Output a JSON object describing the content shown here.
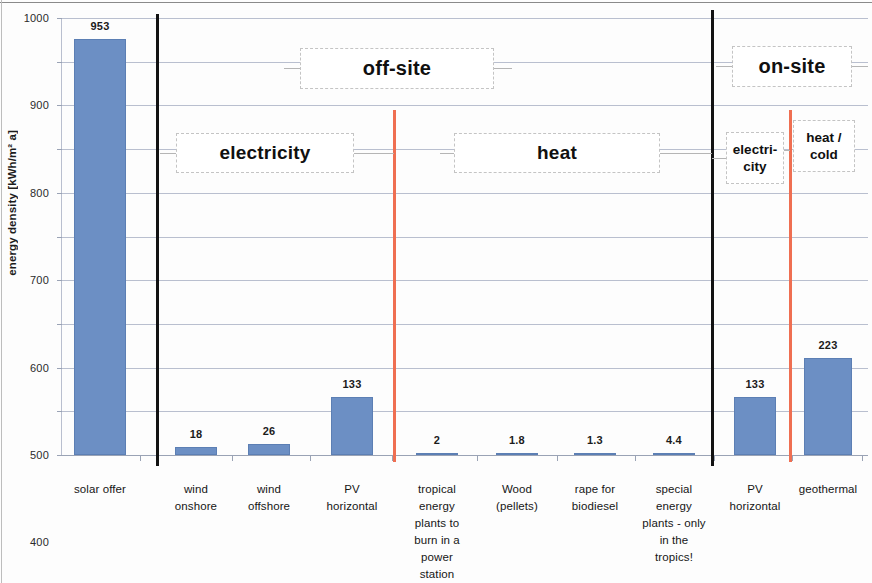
{
  "chart_data": {
    "type": "bar",
    "title": "",
    "xlabel": "",
    "ylabel": "energy density [kWh/m² a]",
    "ylim": [
      0,
      1000
    ],
    "ytick_step": 100,
    "yticks": [
      "1000",
      "900",
      "800",
      "700",
      "600",
      "500",
      "400",
      "300",
      "200",
      "100",
      "0"
    ],
    "grid": true,
    "legend": "none",
    "bar_color": "#6c8fc4",
    "categories": [
      "solar offer",
      "wind onshore",
      "wind offshore",
      "PV horizontal",
      "tropical energy plants to burn in a power station",
      "Wood (pellets)",
      "rape for biodiesel",
      "special energy plants - only in the tropics!",
      "PV horizontal",
      "geothermal"
    ],
    "category_lines": [
      [
        "solar offer"
      ],
      [
        "wind",
        "onshore"
      ],
      [
        "wind",
        "offshore"
      ],
      [
        "PV",
        "horizontal"
      ],
      [
        "tropical",
        "energy",
        "plants to",
        "burn in a",
        "power",
        "station"
      ],
      [
        "Wood",
        "(pellets)"
      ],
      [
        "rape for",
        "biodiesel"
      ],
      [
        "special",
        "energy",
        "plants - only",
        "in the",
        "tropics!"
      ],
      [
        "PV",
        "horizontal"
      ],
      [
        "geothermal"
      ]
    ],
    "values": [
      953,
      18,
      26,
      133,
      2,
      1.8,
      1.3,
      4.4,
      133,
      223
    ],
    "value_labels": [
      "953",
      "18",
      "26",
      "133",
      "2",
      "1.8",
      "1.3",
      "4.4",
      "133",
      "223"
    ]
  },
  "annotations": {
    "off_site": "off-site",
    "on_site": "on-site",
    "electricity": "electricity",
    "heat": "heat",
    "electricity_small": "electri-\ncity",
    "electricity_small_lines": [
      "electri-",
      "city"
    ],
    "heat_cold_lines": [
      "heat /",
      "cold"
    ]
  },
  "colors": {
    "bar": "#6c8fc4",
    "separator_black": "#121212",
    "separator_red": "#ef6f52",
    "gridline": "#b9bfcf"
  }
}
